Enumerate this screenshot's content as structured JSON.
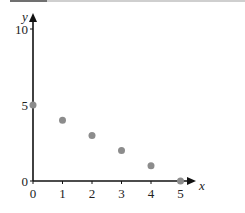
{
  "chart_data": {
    "type": "scatter",
    "title": "",
    "xlabel": "x",
    "ylabel": "y",
    "xlim": [
      0,
      5
    ],
    "ylim": [
      0,
      10
    ],
    "x_ticks": [
      0,
      1,
      2,
      3,
      4,
      5
    ],
    "y_ticks": [
      0,
      5,
      10
    ],
    "grid": false,
    "legend": null,
    "series": [
      {
        "name": "points",
        "color": "#8c8c8c",
        "x": [
          0,
          1,
          2,
          3,
          4,
          5
        ],
        "y": [
          5,
          4,
          3,
          2,
          1,
          0
        ]
      }
    ]
  },
  "colors": {
    "axis": "#111111",
    "point": "#8c8c8c",
    "text": "#222222"
  }
}
